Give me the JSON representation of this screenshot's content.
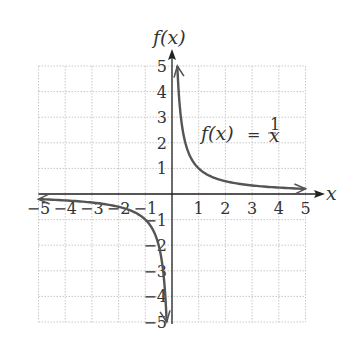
{
  "chart_data": {
    "type": "line",
    "title": "",
    "function_label": "f(x) = 1/x",
    "function_label_parts": {
      "lhs": "f(x)",
      "eq": "=",
      "num": "1",
      "den": "x"
    },
    "xlabel": "x",
    "ylabel": "f(x)",
    "xlim": [
      -5,
      5
    ],
    "ylim": [
      -5,
      5
    ],
    "grid": true,
    "x_ticks": [
      "-5",
      "-4",
      "-3",
      "-2",
      "-1",
      "1",
      "2",
      "3",
      "4",
      "5"
    ],
    "y_ticks": [
      "5",
      "4",
      "3",
      "2",
      "1",
      "-1",
      "-2",
      "-3",
      "-4",
      "-5"
    ],
    "series": [
      {
        "name": "f(x) = 1/x (x>0 branch)",
        "x": [
          0.2,
          0.25,
          0.333,
          0.5,
          1,
          2,
          3,
          4,
          5
        ],
        "y": [
          5,
          4,
          3,
          2,
          1,
          0.5,
          0.333,
          0.25,
          0.2
        ]
      },
      {
        "name": "f(x) = 1/x (x<0 branch)",
        "x": [
          -5,
          -4,
          -3,
          -2,
          -1,
          -0.5,
          -0.333,
          -0.25,
          -0.2
        ],
        "y": [
          -0.2,
          -0.25,
          -0.333,
          -0.5,
          -1,
          -2,
          -3,
          -4,
          -5
        ]
      }
    ],
    "colors": {
      "curve": "#555555",
      "axis": "#222222",
      "grid": "#c8c8c8"
    }
  }
}
